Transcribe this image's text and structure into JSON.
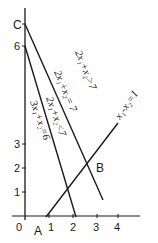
{
  "diagram": {
    "type": "linear-inequality-graph",
    "axes": {
      "x_ticks": [
        "0",
        "1",
        "2",
        "3",
        "4"
      ],
      "y_ticks": [
        "1",
        "2",
        "3",
        "6"
      ],
      "color": "#1a1a1a"
    },
    "points": {
      "A": "A",
      "B": "B",
      "C": "C"
    },
    "lines": [
      {
        "name": "2x1+x2=7",
        "label": "2x₁+x₂= 7"
      },
      {
        "name": "3x1+x2=6",
        "label": "3x₁+x₂=6"
      },
      {
        "name": "x1-x2=1",
        "label": "x₁-x₂=1"
      }
    ],
    "regions": [
      {
        "label": "2x₁+x₂>7"
      },
      {
        "label": "2x₁+x₂<7"
      }
    ]
  }
}
